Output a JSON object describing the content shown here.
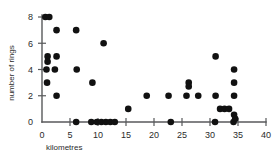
{
  "chart_data": {
    "type": "scatter",
    "title": "",
    "xlabel": "kilometres",
    "ylabel": "number of rings",
    "xlim": [
      0,
      40
    ],
    "ylim": [
      0,
      8.4
    ],
    "xticks": [
      0,
      5,
      10,
      15,
      20,
      25,
      30,
      35,
      40
    ],
    "xticklabels": [
      "0",
      "5",
      "10",
      "15",
      "20",
      "25",
      "30",
      "35",
      "40"
    ],
    "yticks": [
      0,
      2,
      4,
      6,
      8
    ],
    "yticklabels": [
      "0",
      "2",
      "4",
      "6",
      "8"
    ],
    "grid": false,
    "legend": null,
    "marker": "filled-circle",
    "marker_color": "#111111",
    "points": [
      {
        "x": 0.6,
        "y": 8
      },
      {
        "x": 1.3,
        "y": 8
      },
      {
        "x": 2.6,
        "y": 7
      },
      {
        "x": 6.1,
        "y": 7
      },
      {
        "x": 11.0,
        "y": 6
      },
      {
        "x": 31.0,
        "y": 5
      },
      {
        "x": 1.0,
        "y": 5
      },
      {
        "x": 2.6,
        "y": 5
      },
      {
        "x": 1.0,
        "y": 4.6
      },
      {
        "x": 0.8,
        "y": 4
      },
      {
        "x": 2.3,
        "y": 4
      },
      {
        "x": 6.2,
        "y": 4
      },
      {
        "x": 34.3,
        "y": 4
      },
      {
        "x": 0.9,
        "y": 3
      },
      {
        "x": 9.0,
        "y": 3
      },
      {
        "x": 26.2,
        "y": 3
      },
      {
        "x": 34.3,
        "y": 3
      },
      {
        "x": 26.2,
        "y": 2.7
      },
      {
        "x": 2.6,
        "y": 2
      },
      {
        "x": 18.7,
        "y": 2
      },
      {
        "x": 22.6,
        "y": 2
      },
      {
        "x": 25.8,
        "y": 2
      },
      {
        "x": 27.9,
        "y": 2
      },
      {
        "x": 31.0,
        "y": 2
      },
      {
        "x": 34.3,
        "y": 2
      },
      {
        "x": 15.4,
        "y": 1
      },
      {
        "x": 31.8,
        "y": 1
      },
      {
        "x": 32.6,
        "y": 1
      },
      {
        "x": 33.4,
        "y": 1
      },
      {
        "x": 34.3,
        "y": 0.55
      },
      {
        "x": 6.1,
        "y": 0
      },
      {
        "x": 8.8,
        "y": 0
      },
      {
        "x": 9.8,
        "y": 0
      },
      {
        "x": 10.6,
        "y": 0
      },
      {
        "x": 11.4,
        "y": 0
      },
      {
        "x": 12.2,
        "y": 0
      },
      {
        "x": 13.0,
        "y": 0
      },
      {
        "x": 23.0,
        "y": 0
      },
      {
        "x": 30.9,
        "y": 0
      },
      {
        "x": 34.2,
        "y": 0
      },
      {
        "x": 34.5,
        "y": 0.25
      }
    ]
  },
  "axes": {
    "x_axis_name": "x-axis",
    "y_axis_name": "y-axis"
  }
}
